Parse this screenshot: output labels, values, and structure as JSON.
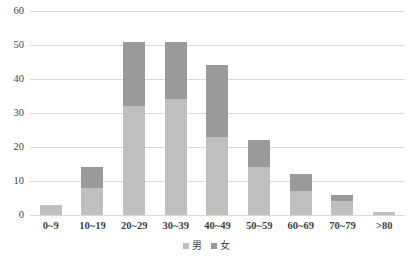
{
  "chart_data": {
    "type": "bar",
    "subtype": "stacked-bar",
    "title": "",
    "xlabel": "",
    "ylabel": "",
    "ylim": [
      0,
      60
    ],
    "yticks": [
      0,
      10,
      20,
      30,
      40,
      50,
      60
    ],
    "grid": true,
    "legend_position": "bottom-center",
    "categories": [
      "0~9",
      "10~19",
      "20~29",
      "30~39",
      "40~49",
      "50~59",
      "60~69",
      "70~79",
      ">80"
    ],
    "series": [
      {
        "name": "男",
        "color": "#bfbfbf",
        "values": [
          3,
          8,
          32,
          34,
          23,
          14,
          7,
          4,
          1
        ]
      },
      {
        "name": "女",
        "color": "#9a9a9a",
        "values": [
          0,
          6,
          19,
          17,
          21,
          8,
          5,
          2,
          0
        ]
      }
    ],
    "totals": [
      3,
      14,
      51,
      51,
      44,
      22,
      12,
      6,
      1
    ]
  },
  "axis": {
    "y_tick_labels": [
      "0",
      "10",
      "20",
      "30",
      "40",
      "50",
      "60"
    ],
    "x_tick_labels": [
      "0~9",
      "10~19",
      "20~29",
      "30~39",
      "40~49",
      "50~59",
      "60~69",
      "70~79",
      ">80"
    ]
  },
  "legend": {
    "items": [
      {
        "label": "男",
        "swatch": "male-swatch-icon"
      },
      {
        "label": "女",
        "swatch": "female-swatch-icon"
      }
    ]
  },
  "colors": {
    "male": "#bfbfbf",
    "female": "#9a9a9a",
    "gridline": "#d9d9d9",
    "text": "#3f3f3f",
    "background": "#ffffff"
  }
}
